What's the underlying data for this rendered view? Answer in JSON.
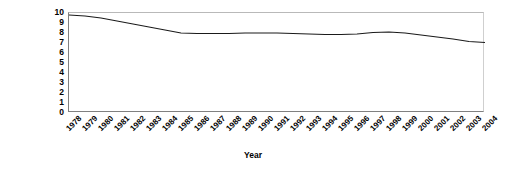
{
  "chart_data": {
    "type": "line",
    "title": "",
    "xlabel": "Year",
    "ylabel": "Litres per 100 kilometres",
    "x": [
      1978,
      1979,
      1980,
      1981,
      1982,
      1983,
      1984,
      1985,
      1986,
      1987,
      1988,
      1989,
      1990,
      1991,
      1992,
      1993,
      1994,
      1995,
      1996,
      1997,
      1998,
      1999,
      2000,
      2001,
      2002,
      2003,
      2004
    ],
    "categories": [
      "1978",
      "1979",
      "1980",
      "1981",
      "1982",
      "1983",
      "1984",
      "1985",
      "1986",
      "1987",
      "1988",
      "1989",
      "1990",
      "1991",
      "1992",
      "1993",
      "1994",
      "1995",
      "1996",
      "1997",
      "1998",
      "1999",
      "2000",
      "2001",
      "2002",
      "2003",
      "2004"
    ],
    "values": [
      9.8,
      9.7,
      9.5,
      9.2,
      8.9,
      8.6,
      8.3,
      8.0,
      7.95,
      7.95,
      7.95,
      8.0,
      8.0,
      8.0,
      7.95,
      7.9,
      7.85,
      7.85,
      7.9,
      8.05,
      8.1,
      8.0,
      7.8,
      7.6,
      7.4,
      7.15,
      7.05
    ],
    "series": [
      {
        "name": "Litres per 100 kilometres",
        "color": "#1a1a1a",
        "values": [
          9.8,
          9.7,
          9.5,
          9.2,
          8.9,
          8.6,
          8.3,
          8.0,
          7.95,
          7.95,
          7.95,
          8.0,
          8.0,
          8.0,
          7.95,
          7.9,
          7.85,
          7.85,
          7.9,
          8.05,
          8.1,
          8.0,
          7.8,
          7.6,
          7.4,
          7.15,
          7.05
        ]
      }
    ],
    "yticks": [
      10,
      9,
      8,
      7,
      6,
      5,
      4,
      3,
      2,
      1,
      0
    ],
    "ytick_labels": [
      "10",
      "9",
      "8",
      "7",
      "6",
      "5",
      "4",
      "3",
      "2",
      "1",
      "0"
    ],
    "ylim": [
      0,
      10
    ],
    "xlim": [
      1978,
      2004
    ],
    "grid": false,
    "legend": false,
    "legend_position": "none",
    "line_color": "#1a1a1a",
    "plot_background": "#ffffff",
    "axis_color": "#808080"
  }
}
